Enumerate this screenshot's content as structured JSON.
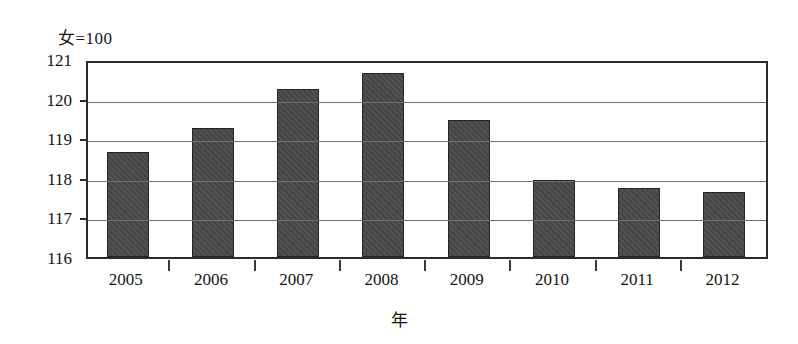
{
  "chart_data": {
    "type": "bar",
    "title": "",
    "subtitle": "",
    "unit_label": "女=100",
    "xlabel": "年",
    "ylabel": "",
    "categories": [
      "2005",
      "2006",
      "2007",
      "2008",
      "2009",
      "2010",
      "2011",
      "2012"
    ],
    "values": [
      118.7,
      119.3,
      120.3,
      120.7,
      119.5,
      118.0,
      117.8,
      117.7
    ],
    "ylim": [
      116,
      121
    ],
    "yticks": [
      121,
      120,
      119,
      118,
      117,
      116
    ],
    "ytick_labels": [
      "121",
      "120",
      "119",
      "118",
      "117",
      "116"
    ],
    "grid": true,
    "grid_axis": "y",
    "legend": false,
    "legend_position": "none",
    "series": [
      {
        "name": "性别比",
        "values": [
          118.7,
          119.3,
          120.3,
          120.7,
          119.5,
          118.0,
          117.8,
          117.7
        ],
        "color": "#4b4948"
      }
    ],
    "colors": {
      "bar_fill": "#4b4948",
      "bar_stroke": "#262524",
      "frame": "#2b2b2b",
      "gridline": "#6f6f6f",
      "text": "#141414",
      "background": "#ffffff"
    }
  }
}
